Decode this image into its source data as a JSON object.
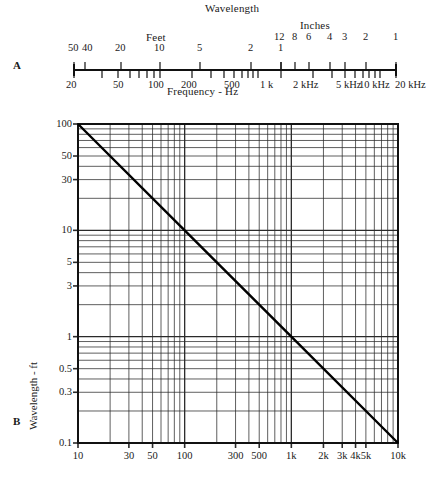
{
  "figure": {
    "panels": [
      {
        "letter": "A",
        "kind": "nomograph-ruler"
      },
      {
        "letter": "B",
        "kind": "log-log-chart"
      }
    ]
  },
  "panel_a": {
    "letter": "A",
    "title": "Wavelength",
    "feet_label": "Feet",
    "inches_label": "Inches",
    "axis_title": "Frequency - Hz",
    "feet_ticks": [
      "50",
      "40",
      "20",
      "10",
      "5",
      "2",
      "1"
    ],
    "inches_ticks": [
      "12",
      "8",
      "6",
      "4",
      "3",
      "2",
      "1"
    ],
    "frequency_ticks": [
      "20",
      "50",
      "100",
      "200",
      "500",
      "1 k",
      "2 kHz",
      "5 kHz",
      "10 kHz",
      "20 kHz"
    ]
  },
  "panel_b": {
    "letter": "B",
    "xlabel": "Frequency - Hz",
    "ylabel": "Wavelength - ft"
  },
  "chart_data": {
    "type": "line",
    "xlabel": "Frequency - Hz",
    "ylabel": "Wavelength - ft",
    "xscale": "log",
    "yscale": "log",
    "xlim": [
      10,
      10000
    ],
    "ylim": [
      0.1,
      100
    ],
    "grid": true,
    "legend": "none",
    "xticklabels": [
      "10",
      "30",
      "50",
      "100",
      "300",
      "500",
      "1k",
      "2k",
      "3k",
      "4k",
      "5k",
      "10k"
    ],
    "xtickvalues": [
      10,
      30,
      50,
      100,
      300,
      500,
      1000,
      2000,
      3000,
      4000,
      5000,
      10000
    ],
    "yticklabels": [
      "100",
      "50",
      "30",
      "10",
      "5",
      "3",
      "1",
      "0.5",
      "0.3",
      "0.1"
    ],
    "ytickvalues": [
      100,
      50,
      30,
      10,
      5,
      3,
      1,
      0.5,
      0.3,
      0.1
    ],
    "series": [
      {
        "name": "wavelength",
        "x": [
          10,
          100,
          1000,
          10000
        ],
        "y": [
          100,
          10,
          1,
          0.1
        ]
      }
    ],
    "relation": "wavelength_ft = 1130 / frequency_Hz (approx, plotted as 1000/f)"
  }
}
